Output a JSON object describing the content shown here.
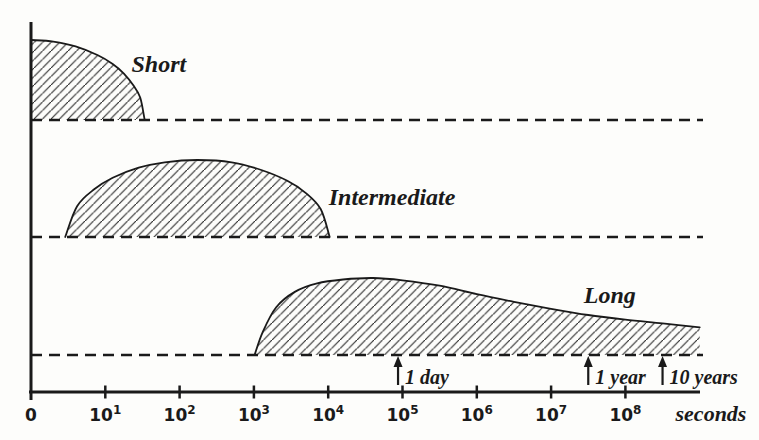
{
  "figure": {
    "background": "#fdfdfb",
    "ink": "#1a1a1a",
    "hatch_color": "#2b2b2b"
  },
  "chart_data": {
    "type": "area",
    "title": "",
    "xlabel": "seconds",
    "x_axis": {
      "scale": "log10(seconds)",
      "origin_tick_label": "0",
      "decade_ticks": [
        {
          "base": "10",
          "exp": "1",
          "decade": 1
        },
        {
          "base": "10",
          "exp": "2",
          "decade": 2
        },
        {
          "base": "10",
          "exp": "3",
          "decade": 3
        },
        {
          "base": "10",
          "exp": "4",
          "decade": 4
        },
        {
          "base": "10",
          "exp": "5",
          "decade": 5
        },
        {
          "base": "10",
          "exp": "6",
          "decade": 6
        },
        {
          "base": "10",
          "exp": "7",
          "decade": 7
        },
        {
          "base": "10",
          "exp": "8",
          "decade": 8
        }
      ]
    },
    "series": [
      {
        "name": "Short",
        "label": {
          "text": "Short",
          "x_decade": 1.72,
          "y_frac": 0.6
        },
        "points": [
          [
            0,
            1.0
          ],
          [
            0.3,
            0.98
          ],
          [
            0.6,
            0.92
          ],
          [
            0.9,
            0.81
          ],
          [
            1.1,
            0.7
          ],
          [
            1.25,
            0.58
          ],
          [
            1.38,
            0.43
          ],
          [
            1.47,
            0.28
          ],
          [
            1.53,
            0.0
          ]
        ],
        "starts_on_y_axis": true,
        "right_cutoff": false
      },
      {
        "name": "Intermediate",
        "label": {
          "text": "Intermediate",
          "x_decade": 4.86,
          "y_frac": 0.42
        },
        "points": [
          [
            0.46,
            0.0
          ],
          [
            0.62,
            0.4
          ],
          [
            0.85,
            0.62
          ],
          [
            1.1,
            0.77
          ],
          [
            1.45,
            0.9
          ],
          [
            1.8,
            0.97
          ],
          [
            2.24,
            1.0
          ],
          [
            2.7,
            0.97
          ],
          [
            3.1,
            0.87
          ],
          [
            3.45,
            0.73
          ],
          [
            3.7,
            0.57
          ],
          [
            3.9,
            0.36
          ],
          [
            4.02,
            0.0
          ]
        ],
        "starts_on_y_axis": false,
        "right_cutoff": false
      },
      {
        "name": "Long",
        "label": {
          "text": "Long",
          "x_decade": 7.79,
          "y_frac": 0.675
        },
        "points": [
          [
            3.01,
            0.0
          ],
          [
            3.12,
            0.3
          ],
          [
            3.3,
            0.62
          ],
          [
            3.55,
            0.82
          ],
          [
            3.85,
            0.93
          ],
          [
            4.2,
            0.98
          ],
          [
            4.6,
            1.0
          ],
          [
            5.0,
            0.97
          ],
          [
            5.5,
            0.9
          ],
          [
            6.0,
            0.79
          ],
          [
            6.5,
            0.69
          ],
          [
            7.0,
            0.6
          ],
          [
            7.5,
            0.52
          ],
          [
            8.0,
            0.46
          ],
          [
            8.5,
            0.41
          ],
          [
            9.0,
            0.36
          ]
        ],
        "starts_on_y_axis": false,
        "right_cutoff": true
      }
    ],
    "annotations": [
      {
        "text": "1 day",
        "x_decade": 4.94
      },
      {
        "text": "1 year",
        "x_decade": 7.5
      },
      {
        "text": "10 years",
        "x_decade": 8.5
      }
    ]
  }
}
